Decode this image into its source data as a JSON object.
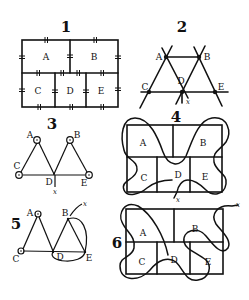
{
  "figures": [
    {
      "number": "1",
      "caption": "Königsberg bridges map",
      "regions": [
        "A",
        "B",
        "C",
        "D",
        "E"
      ]
    },
    {
      "number": "2",
      "caption": "Graph with extended lines",
      "vertices": [
        "A",
        "B",
        "C",
        "D",
        "E"
      ],
      "exit": "x"
    },
    {
      "number": "3",
      "caption": "Graph with ring vertices",
      "vertices": [
        "A",
        "B",
        "C",
        "D",
        "E"
      ],
      "exit": "x"
    },
    {
      "number": "4",
      "caption": "Rectangle regions with path",
      "regions": [
        "A",
        "B",
        "C",
        "D",
        "E"
      ],
      "exit": "x"
    },
    {
      "number": "5",
      "caption": "Graph with curved path",
      "vertices": [
        "A",
        "B",
        "C",
        "D",
        "E"
      ],
      "exit": "x"
    },
    {
      "number": "6",
      "caption": "Rectangle regions with path",
      "regions": [
        "A",
        "B",
        "C",
        "D",
        "E"
      ],
      "exit": "x"
    }
  ],
  "colors": {
    "ink": "#111111",
    "paper": "#ffffff"
  }
}
